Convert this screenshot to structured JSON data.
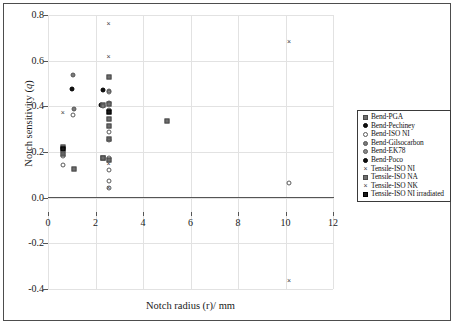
{
  "chart_data": {
    "type": "scatter",
    "title": "",
    "xlabel": "Notch radius (r)/ mm",
    "ylabel": "Notch sensitivity (q)",
    "xlim": [
      0,
      12
    ],
    "ylim": [
      -0.4,
      0.8
    ],
    "xticks": [
      "0",
      "2",
      "4",
      "6",
      "8",
      "10",
      "12"
    ],
    "xtick_values": [
      0,
      2,
      4,
      6,
      8,
      10,
      12
    ],
    "yticks": [
      "0.8",
      "0.6",
      "0.4",
      "0.2",
      "0.0",
      "-0.2",
      "-0.4"
    ],
    "ytick_values": [
      0.8,
      0.6,
      0.4,
      0.2,
      0.0,
      -0.2,
      -0.4
    ],
    "grid": true,
    "legend_position": "right",
    "series": [
      {
        "name": "Bend-PGA",
        "marker": "filled-square-grey",
        "points": [
          {
            "x": 0.65,
            "y": 0.205
          },
          {
            "x": 0.65,
            "y": 0.19
          },
          {
            "x": 1.1,
            "y": 0.125
          },
          {
            "x": 2.3,
            "y": 0.405
          },
          {
            "x": 2.55,
            "y": 0.41
          },
          {
            "x": 2.55,
            "y": 0.345
          },
          {
            "x": 2.55,
            "y": 0.315
          },
          {
            "x": 2.55,
            "y": 0.255
          },
          {
            "x": 2.3,
            "y": 0.175
          },
          {
            "x": 2.55,
            "y": 0.165
          },
          {
            "x": 5.0,
            "y": 0.335
          }
        ]
      },
      {
        "name": "Bend-Pechiney",
        "marker": "filled-circle-black",
        "points": [
          {
            "x": 1.0,
            "y": 0.478
          },
          {
            "x": 2.3,
            "y": 0.472
          },
          {
            "x": 2.25,
            "y": 0.408
          }
        ]
      },
      {
        "name": "Bend-ISO NI",
        "marker": "open-circle",
        "points": [
          {
            "x": 0.62,
            "y": 0.145
          },
          {
            "x": 0.65,
            "y": 0.182
          },
          {
            "x": 1.05,
            "y": 0.36
          },
          {
            "x": 2.55,
            "y": 0.463
          },
          {
            "x": 2.55,
            "y": 0.288
          },
          {
            "x": 2.55,
            "y": 0.253
          },
          {
            "x": 2.55,
            "y": 0.175
          },
          {
            "x": 2.55,
            "y": 0.122
          },
          {
            "x": 2.55,
            "y": 0.073
          },
          {
            "x": 2.55,
            "y": 0.042
          },
          {
            "x": 10.15,
            "y": 0.065
          }
        ]
      },
      {
        "name": "Bend-Gilsocarbon",
        "marker": "filled-circle-grey",
        "points": [
          {
            "x": 1.05,
            "y": 0.538
          },
          {
            "x": 1.1,
            "y": 0.39
          },
          {
            "x": 2.55,
            "y": 0.415
          },
          {
            "x": 2.32,
            "y": 0.402
          }
        ]
      },
      {
        "name": "Bend-EK78",
        "marker": "filled-circle-grey2",
        "points": [
          {
            "x": 2.55,
            "y": 0.467
          },
          {
            "x": 2.55,
            "y": 0.385
          }
        ]
      },
      {
        "name": "Bend-Poco",
        "marker": "filled-circle-black",
        "points": [
          {
            "x": 1.0,
            "y": 0.478
          },
          {
            "x": 2.3,
            "y": 0.472
          }
        ]
      },
      {
        "name": "Tensile-ISO NI",
        "marker": "cross-x",
        "points": [
          {
            "x": 0.62,
            "y": 0.372
          },
          {
            "x": 2.55,
            "y": 0.762
          },
          {
            "x": 2.55,
            "y": 0.618
          },
          {
            "x": 2.55,
            "y": 0.148
          },
          {
            "x": 2.55,
            "y": 0.043
          },
          {
            "x": 10.15,
            "y": 0.682
          },
          {
            "x": 10.15,
            "y": -0.365
          }
        ]
      },
      {
        "name": "Tensile-ISO NA",
        "marker": "filled-square-grey",
        "points": [
          {
            "x": 0.65,
            "y": 0.22
          },
          {
            "x": 2.55,
            "y": 0.53
          },
          {
            "x": 2.3,
            "y": 0.172
          }
        ]
      },
      {
        "name": "Tensile-ISO NK",
        "marker": "cross-x",
        "points": [
          {
            "x": 0.62,
            "y": 0.372
          },
          {
            "x": 2.55,
            "y": 0.148
          }
        ]
      },
      {
        "name": "Tensile-ISO NI irradiated",
        "marker": "filled-square-black",
        "points": [
          {
            "x": 0.65,
            "y": 0.213
          },
          {
            "x": 2.55,
            "y": 0.375
          }
        ]
      }
    ],
    "all_points": [
      {
        "x": 0.62,
        "y": 0.372,
        "marker": "cross-x"
      },
      {
        "x": 0.62,
        "y": 0.145,
        "marker": "open-circle"
      },
      {
        "x": 0.65,
        "y": 0.22,
        "marker": "filled-square-grey"
      },
      {
        "x": 0.65,
        "y": 0.213,
        "marker": "filled-square-black"
      },
      {
        "x": 0.65,
        "y": 0.19,
        "marker": "filled-square-grey"
      },
      {
        "x": 0.65,
        "y": 0.182,
        "marker": "open-circle"
      },
      {
        "x": 1.0,
        "y": 0.478,
        "marker": "filled-circle-black"
      },
      {
        "x": 1.05,
        "y": 0.538,
        "marker": "filled-circle-grey"
      },
      {
        "x": 1.05,
        "y": 0.36,
        "marker": "open-circle"
      },
      {
        "x": 1.1,
        "y": 0.39,
        "marker": "filled-circle-grey"
      },
      {
        "x": 1.1,
        "y": 0.125,
        "marker": "filled-square-grey"
      },
      {
        "x": 2.25,
        "y": 0.408,
        "marker": "filled-circle-black"
      },
      {
        "x": 2.3,
        "y": 0.472,
        "marker": "filled-circle-black"
      },
      {
        "x": 2.3,
        "y": 0.405,
        "marker": "filled-square-grey"
      },
      {
        "x": 2.32,
        "y": 0.402,
        "marker": "filled-circle-grey"
      },
      {
        "x": 2.3,
        "y": 0.175,
        "marker": "filled-square-grey"
      },
      {
        "x": 2.3,
        "y": 0.172,
        "marker": "filled-square-grey"
      },
      {
        "x": 2.55,
        "y": 0.762,
        "marker": "cross-x"
      },
      {
        "x": 2.55,
        "y": 0.618,
        "marker": "cross-x"
      },
      {
        "x": 2.55,
        "y": 0.53,
        "marker": "filled-square-grey"
      },
      {
        "x": 2.55,
        "y": 0.467,
        "marker": "filled-circle-grey2"
      },
      {
        "x": 2.55,
        "y": 0.463,
        "marker": "open-circle"
      },
      {
        "x": 2.55,
        "y": 0.415,
        "marker": "filled-circle-grey"
      },
      {
        "x": 2.55,
        "y": 0.41,
        "marker": "filled-square-grey"
      },
      {
        "x": 2.55,
        "y": 0.385,
        "marker": "filled-circle-grey2"
      },
      {
        "x": 2.55,
        "y": 0.375,
        "marker": "filled-square-black"
      },
      {
        "x": 2.55,
        "y": 0.345,
        "marker": "filled-square-grey"
      },
      {
        "x": 2.55,
        "y": 0.315,
        "marker": "filled-square-grey"
      },
      {
        "x": 2.55,
        "y": 0.288,
        "marker": "open-circle"
      },
      {
        "x": 2.55,
        "y": 0.255,
        "marker": "filled-square-grey"
      },
      {
        "x": 2.55,
        "y": 0.253,
        "marker": "open-circle"
      },
      {
        "x": 2.55,
        "y": 0.175,
        "marker": "open-circle"
      },
      {
        "x": 2.55,
        "y": 0.165,
        "marker": "filled-square-grey"
      },
      {
        "x": 2.55,
        "y": 0.148,
        "marker": "cross-x"
      },
      {
        "x": 2.55,
        "y": 0.122,
        "marker": "open-circle"
      },
      {
        "x": 2.55,
        "y": 0.073,
        "marker": "open-circle"
      },
      {
        "x": 2.55,
        "y": 0.042,
        "marker": "open-circle"
      },
      {
        "x": 2.55,
        "y": 0.043,
        "marker": "cross-x"
      },
      {
        "x": 5.0,
        "y": 0.335,
        "marker": "filled-square-grey"
      },
      {
        "x": 10.15,
        "y": 0.682,
        "marker": "cross-x"
      },
      {
        "x": 10.15,
        "y": 0.065,
        "marker": "open-circle"
      },
      {
        "x": 10.15,
        "y": -0.365,
        "marker": "cross-x"
      }
    ]
  },
  "legend": {
    "items": [
      {
        "label": "Bend-PGA",
        "marker": "filled-square-grey"
      },
      {
        "label": "Bend-Pechiney",
        "marker": "filled-circle-black"
      },
      {
        "label": "Bend-ISO NI",
        "marker": "open-circle"
      },
      {
        "label": "Bend-Gilsocarbon",
        "marker": "filled-circle-grey"
      },
      {
        "label": "Bend-EK78",
        "marker": "filled-circle-grey2"
      },
      {
        "label": "Bend-Poco",
        "marker": "filled-circle-black"
      },
      {
        "label": "Tensile-ISO NI",
        "marker": "cross-x"
      },
      {
        "label": "Tensile-ISO NA",
        "marker": "filled-square-grey"
      },
      {
        "label": "Tensile-ISO NK",
        "marker": "cross-x"
      },
      {
        "label": "Tensile-ISO NI irradiated",
        "marker": "filled-square-black"
      }
    ]
  },
  "colors": {
    "axis": "#555555",
    "grid": "#e2e2e2",
    "frame": "#4d4d4d",
    "text": "#1a1a1a"
  }
}
